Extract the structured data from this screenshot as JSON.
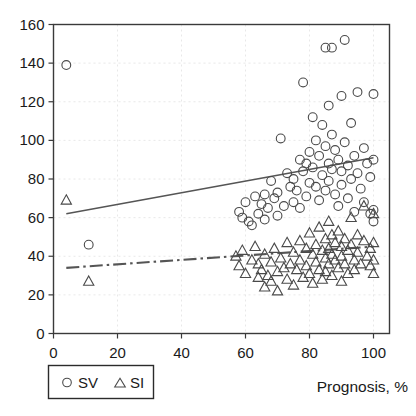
{
  "chart_data": {
    "type": "scatter",
    "title": "",
    "xlabel": "Prognosis, %",
    "ylabel": "",
    "xlim": [
      0,
      105
    ],
    "ylim": [
      0,
      160
    ],
    "xticks": [
      0,
      20,
      40,
      60,
      80,
      100
    ],
    "yticks": [
      0,
      20,
      40,
      60,
      80,
      100,
      120,
      140,
      160
    ],
    "xtick_labels": [
      "0",
      "20",
      "40",
      "60",
      "80",
      "100"
    ],
    "ytick_labels": [
      "0",
      "20",
      "40",
      "60",
      "80",
      "100",
      "120",
      "140",
      "160"
    ],
    "grid": true,
    "legend_position": "below-left",
    "legend": [
      {
        "label": "SV",
        "marker": "circle"
      },
      {
        "label": "SI",
        "marker": "triangle"
      }
    ],
    "series": [
      {
        "name": "SV",
        "marker": "circle",
        "points": [
          [
            4,
            139
          ],
          [
            11,
            46
          ],
          [
            58,
            63
          ],
          [
            59,
            60
          ],
          [
            60,
            68
          ],
          [
            61,
            58
          ],
          [
            62,
            56
          ],
          [
            63,
            71
          ],
          [
            64,
            62
          ],
          [
            65,
            67
          ],
          [
            66,
            72
          ],
          [
            66,
            59
          ],
          [
            67,
            65
          ],
          [
            68,
            79
          ],
          [
            69,
            70
          ],
          [
            70,
            73
          ],
          [
            70,
            61
          ],
          [
            71,
            101
          ],
          [
            72,
            66
          ],
          [
            73,
            83
          ],
          [
            74,
            76
          ],
          [
            75,
            80
          ],
          [
            75,
            68
          ],
          [
            76,
            74
          ],
          [
            77,
            90
          ],
          [
            77,
            65
          ],
          [
            78,
            130
          ],
          [
            78,
            84
          ],
          [
            79,
            71
          ],
          [
            79,
            88
          ],
          [
            80,
            78
          ],
          [
            80,
            94
          ],
          [
            81,
            86
          ],
          [
            81,
            112
          ],
          [
            82,
            100
          ],
          [
            82,
            76
          ],
          [
            83,
            92
          ],
          [
            83,
            69
          ],
          [
            84,
            108
          ],
          [
            84,
            82
          ],
          [
            85,
            148
          ],
          [
            85,
            97
          ],
          [
            85,
            74
          ],
          [
            86,
            118
          ],
          [
            86,
            88
          ],
          [
            86,
            79
          ],
          [
            87,
            148
          ],
          [
            87,
            103
          ],
          [
            87,
            85
          ],
          [
            88,
            72
          ],
          [
            88,
            95
          ],
          [
            89,
            90
          ],
          [
            89,
            66
          ],
          [
            90,
            123
          ],
          [
            90,
            84
          ],
          [
            90,
            77
          ],
          [
            91,
            152
          ],
          [
            91,
            99
          ],
          [
            92,
            87
          ],
          [
            92,
            70
          ],
          [
            93,
            109
          ],
          [
            93,
            80
          ],
          [
            94,
            92
          ],
          [
            94,
            63
          ],
          [
            95,
            125
          ],
          [
            95,
            83
          ],
          [
            96,
            75
          ],
          [
            97,
            96
          ],
          [
            97,
            68
          ],
          [
            98,
            88
          ],
          [
            99,
            81
          ],
          [
            99,
            62
          ],
          [
            100,
            124
          ],
          [
            100,
            90
          ],
          [
            100,
            64
          ],
          [
            100,
            58
          ]
        ]
      },
      {
        "name": "SI",
        "marker": "triangle",
        "points": [
          [
            4,
            69
          ],
          [
            11,
            27
          ],
          [
            57,
            40
          ],
          [
            58,
            35
          ],
          [
            59,
            43
          ],
          [
            60,
            31
          ],
          [
            62,
            38
          ],
          [
            63,
            45
          ],
          [
            64,
            29
          ],
          [
            64,
            36
          ],
          [
            65,
            33
          ],
          [
            66,
            41
          ],
          [
            66,
            24
          ],
          [
            67,
            30
          ],
          [
            68,
            37
          ],
          [
            68,
            27
          ],
          [
            69,
            44
          ],
          [
            70,
            32
          ],
          [
            70,
            22
          ],
          [
            71,
            39
          ],
          [
            72,
            34
          ],
          [
            73,
            28
          ],
          [
            73,
            47
          ],
          [
            74,
            36
          ],
          [
            75,
            42
          ],
          [
            75,
            25
          ],
          [
            76,
            33
          ],
          [
            77,
            48
          ],
          [
            77,
            38
          ],
          [
            78,
            29
          ],
          [
            79,
            44
          ],
          [
            79,
            35
          ],
          [
            80,
            52
          ],
          [
            80,
            31
          ],
          [
            81,
            41
          ],
          [
            81,
            26
          ],
          [
            82,
            46
          ],
          [
            82,
            37
          ],
          [
            83,
            55
          ],
          [
            83,
            33
          ],
          [
            84,
            43
          ],
          [
            84,
            28
          ],
          [
            85,
            49
          ],
          [
            85,
            39
          ],
          [
            85,
            32
          ],
          [
            86,
            58
          ],
          [
            86,
            44
          ],
          [
            86,
            36
          ],
          [
            87,
            51
          ],
          [
            87,
            41
          ],
          [
            87,
            30
          ],
          [
            88,
            47
          ],
          [
            88,
            38
          ],
          [
            89,
            53
          ],
          [
            89,
            34
          ],
          [
            90,
            45
          ],
          [
            90,
            40
          ],
          [
            90,
            27
          ],
          [
            91,
            49
          ],
          [
            91,
            36
          ],
          [
            92,
            43
          ],
          [
            92,
            31
          ],
          [
            93,
            60
          ],
          [
            93,
            46
          ],
          [
            94,
            38
          ],
          [
            94,
            33
          ],
          [
            95,
            51
          ],
          [
            95,
            42
          ],
          [
            96,
            36
          ],
          [
            97,
            66
          ],
          [
            97,
            48
          ],
          [
            98,
            40
          ],
          [
            99,
            44
          ],
          [
            99,
            35
          ],
          [
            100,
            62
          ],
          [
            100,
            47
          ],
          [
            100,
            38
          ],
          [
            100,
            31
          ]
        ]
      }
    ],
    "trendlines": [
      {
        "name": "SV-fit",
        "style": "solid",
        "x0": 4,
        "y0": 62,
        "x1": 100,
        "y1": 91
      },
      {
        "name": "SI-fit",
        "style": "dash-dot",
        "x0": 4,
        "y0": 34,
        "x1": 100,
        "y1": 45
      }
    ]
  },
  "colors": {
    "marker_stroke": "#4a4a4a",
    "line_stroke": "#555555",
    "frame_stroke": "#3a3a3a",
    "grid_stroke": "#e2e2e2",
    "text": "#1a1a1a",
    "background": "#ffffff"
  }
}
